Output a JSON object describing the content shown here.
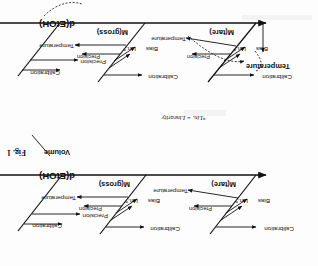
{
  "document": {
    "type": "ishikawa-fishbone-diagram",
    "orientation": "rotated-180",
    "figure_caption": "Fig. 1",
    "footnote": "*Lin. = Linearity",
    "effect_label": "d(EtOH)"
  },
  "diagram_top": {
    "effect": "d(EtOH)",
    "cropped": true,
    "branches": [
      {
        "name": "M(tare)",
        "label": "M(tare)",
        "causes": [
          "Calibration",
          "Bias",
          "Lin.*",
          "Precision",
          "Temperature"
        ]
      },
      {
        "name": "M(gross)",
        "label": "M(gross)",
        "causes": [
          "Calibration",
          "Bias",
          "Lin.*",
          "Precision",
          "Temperature"
        ]
      },
      {
        "name": "Volume",
        "label": "",
        "causes": [
          "Calibration",
          "Precision"
        ]
      }
    ],
    "highlight": {
      "label": "Temperature",
      "style": "bold-with-dashed-arrows"
    }
  },
  "diagram_bottom": {
    "effect": "d(EtOH)",
    "branches": [
      {
        "name": "M(tare)",
        "label": "M(tare)",
        "causes": [
          "Calibration",
          "Bias",
          "Lin.*",
          "Precision",
          "Temperature"
        ]
      },
      {
        "name": "M(gross)",
        "label": "M(gross)",
        "causes": [
          "Calibration",
          "Bias",
          "Lin.*",
          "Precision",
          "Temperature"
        ]
      },
      {
        "name": "Volume",
        "label": "Volume",
        "causes": [
          "Calibration",
          "Precision"
        ]
      }
    ]
  },
  "colors": {
    "ink": "#111111",
    "paper": "#fdfdfd",
    "smudge": "#e9e9e9"
  }
}
